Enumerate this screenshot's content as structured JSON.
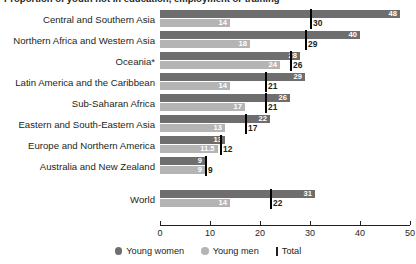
{
  "title": "Proportion of youth not in education, employment or training",
  "chart_data": {
    "type": "bar",
    "title": "Proportion of youth not in education, employment or training",
    "xlabel": "",
    "ylabel": "",
    "orientation": "horizontal",
    "grid": false,
    "xlim": [
      0,
      50
    ],
    "xticks": [
      0,
      10,
      20,
      30,
      40,
      50
    ],
    "xtick_labels": [
      "0",
      "10",
      "20",
      "30",
      "40",
      "50"
    ],
    "legend_position": "bottom",
    "categories": [
      "Central and Southern Asia",
      "Northern Africa and Western Asia",
      "Oceania*",
      "Latin America and the Caribbean",
      "Sub-Saharan Africa",
      "Eastern and South-Eastern Asia",
      "Europe and Northern America",
      "Australia and New Zealand",
      "World"
    ],
    "series": [
      {
        "name": "Young women",
        "color": "#6e6e6e",
        "values": [
          48,
          40,
          28,
          29,
          26,
          22,
          13,
          9,
          31
        ],
        "labels": [
          "48",
          "40",
          "28",
          "29",
          "26",
          "22",
          "13",
          "9",
          "31"
        ]
      },
      {
        "name": "Young men",
        "color": "#b4b4b4",
        "values": [
          14,
          18,
          24,
          14,
          17,
          13,
          11.5,
          9,
          14
        ],
        "labels": [
          "14",
          "18",
          "24",
          "14",
          "17",
          "13",
          "11.5",
          "9",
          "14"
        ]
      },
      {
        "name": "Total",
        "color": "#000000",
        "marker": "vertical-line",
        "values": [
          30,
          29,
          26,
          21,
          21,
          17,
          12,
          9,
          22
        ],
        "labels": [
          "30",
          "29",
          "26",
          "21",
          "21",
          "17",
          "12",
          "9",
          "22"
        ]
      }
    ],
    "footnote": "*"
  },
  "legend": {
    "women_label": "Young women",
    "men_label": "Young men",
    "total_label": "Total"
  }
}
